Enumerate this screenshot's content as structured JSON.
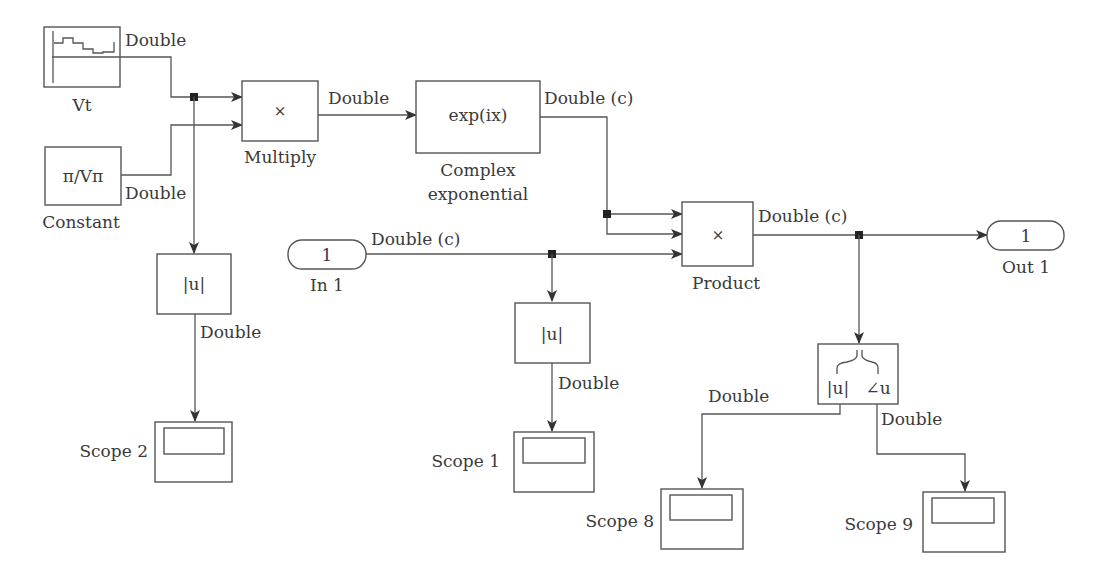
{
  "diagram": {
    "type": "simulink-block-diagram",
    "colors": {
      "stroke": "#555555",
      "text": "#3a3a3a",
      "junction": "#222222",
      "background": "#ffffff"
    },
    "blocks": {
      "vt": {
        "name": "Vt",
        "icon": "stair-signal-icon"
      },
      "constant": {
        "name": "Constant",
        "value": "π/Vπ"
      },
      "multiply": {
        "name": "Multiply",
        "symbol": "×"
      },
      "complex_exp": {
        "name_line1": "Complex",
        "name_line2": "exponential",
        "expr": "exp(ix)"
      },
      "in1": {
        "name": "In 1",
        "port": "1"
      },
      "product": {
        "name": "Product",
        "symbol": "×"
      },
      "out1": {
        "name": "Out 1",
        "port": "1"
      },
      "abs_left": {
        "expr": "|u|"
      },
      "abs_mid": {
        "expr": "|u|"
      },
      "complex_to_mag_angle": {
        "out_mag": "|u|",
        "out_angle": "∠u"
      },
      "scope2": {
        "name": "Scope 2"
      },
      "scope1": {
        "name": "Scope 1"
      },
      "scope8": {
        "name": "Scope 8"
      },
      "scope9": {
        "name": "Scope 9"
      }
    },
    "signals": {
      "vt_out": "Double",
      "constant_out": "Double",
      "multiply_out": "Double",
      "exp_out": "Double (c)",
      "in1_out": "Double (c)",
      "product_out": "Double (c)",
      "abs_left_out": "Double",
      "abs_mid_out": "Double",
      "mag_out": "Double",
      "angle_out": "Double"
    }
  }
}
